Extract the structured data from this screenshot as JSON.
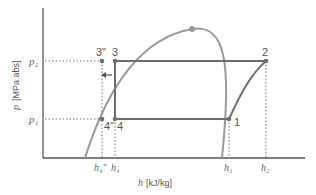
{
  "diagram": {
    "type": "p-h diagram (refrigeration cycle)",
    "y_axis": {
      "symbol": "p",
      "unit": "[MPa abs]"
    },
    "x_axis": {
      "symbol": "h",
      "unit": "[kJ/kg]"
    },
    "pressure_levels": {
      "high": "p₂",
      "low": "p₁"
    },
    "points": {
      "p1": "1",
      "p2": "2",
      "p3": "3",
      "p3pp": "3\"",
      "p4": "4",
      "p4pp": "4\""
    },
    "x_ticks": {
      "h4pp": "h₄\"",
      "h4": "h₄",
      "h1": "h₁",
      "h2": "h₂"
    },
    "colors": {
      "cycle": "#6e6e6e",
      "dome": "#9a9a9a",
      "axes": "#555555",
      "guide": "#777777"
    }
  }
}
